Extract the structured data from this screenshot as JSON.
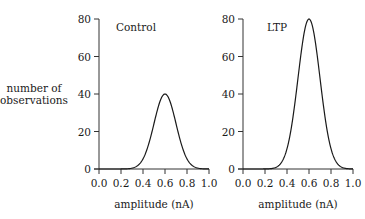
{
  "shared_ylabel": [
    "number of",
    "observations"
  ],
  "chart_data": [
    {
      "type": "line",
      "title": "Control",
      "xlabel": "amplitude (nA)",
      "ylabel": "number of observations",
      "xlim": [
        0.0,
        1.0
      ],
      "ylim": [
        0,
        80
      ],
      "xticks": [
        "0.0",
        "0.2",
        "0.4",
        "0.6",
        "0.8",
        "1.0"
      ],
      "yticks": [
        "0",
        "20",
        "40",
        "60",
        "80"
      ],
      "grid": false,
      "distribution": {
        "shape": "gaussian",
        "mean": 0.6,
        "sd": 0.1,
        "peak": 40
      },
      "x": [
        0.0,
        0.1,
        0.2,
        0.25,
        0.3,
        0.35,
        0.4,
        0.45,
        0.5,
        0.55,
        0.6,
        0.65,
        0.7,
        0.75,
        0.8,
        0.85,
        0.9,
        0.95,
        1.0
      ],
      "values": [
        0,
        0,
        0.01,
        0.09,
        0.44,
        1.76,
        5.41,
        12.98,
        24.26,
        35.3,
        40,
        35.3,
        24.26,
        12.98,
        5.41,
        1.76,
        0.44,
        0.09,
        0.01
      ]
    },
    {
      "type": "line",
      "title": "LTP",
      "xlabel": "amplitude (nA)",
      "ylabel": "",
      "xlim": [
        0.0,
        1.0
      ],
      "ylim": [
        0,
        80
      ],
      "xticks": [
        "0.0",
        "0.2",
        "0.4",
        "0.6",
        "0.8",
        "1.0"
      ],
      "yticks": [
        "0",
        "20",
        "40",
        "60",
        "80"
      ],
      "grid": false,
      "distribution": {
        "shape": "gaussian",
        "mean": 0.6,
        "sd": 0.1,
        "peak": 80
      },
      "x": [
        0.0,
        0.1,
        0.2,
        0.25,
        0.3,
        0.35,
        0.4,
        0.45,
        0.5,
        0.55,
        0.6,
        0.65,
        0.7,
        0.75,
        0.8,
        0.85,
        0.9,
        0.95,
        1.0
      ],
      "values": [
        0,
        0,
        0.03,
        0.17,
        0.89,
        3.51,
        10.83,
        25.96,
        48.52,
        70.6,
        80,
        70.6,
        48.52,
        25.96,
        10.83,
        3.51,
        0.89,
        0.17,
        0.03
      ]
    }
  ]
}
